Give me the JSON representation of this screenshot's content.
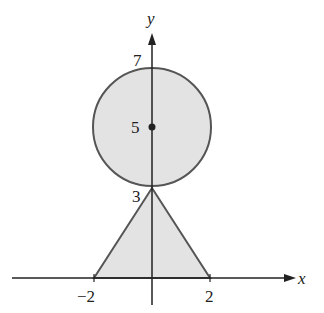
{
  "figure": {
    "axes": {
      "x_label": "x",
      "y_label": "y",
      "x_ticks": [
        {
          "value": -2,
          "label": "−2"
        },
        {
          "value": 2,
          "label": "2"
        }
      ],
      "y_ticks": [
        {
          "value": 7,
          "label": "7"
        },
        {
          "value": 5,
          "label": "5"
        },
        {
          "value": 3,
          "label": "3"
        }
      ]
    },
    "shapes": {
      "circle": {
        "center": [
          0,
          5
        ],
        "radius": 2,
        "fill": "#e3e3e3",
        "stroke": "#555555"
      },
      "triangle": {
        "vertices": [
          [
            -2,
            0
          ],
          [
            2,
            0
          ],
          [
            0,
            3
          ]
        ],
        "fill": "#e3e3e3",
        "stroke": "#555555"
      },
      "center_point": {
        "x": 0,
        "y": 5
      }
    },
    "colors": {
      "axis": "#222222",
      "fill": "#e3e3e3",
      "outline": "#555555"
    }
  }
}
